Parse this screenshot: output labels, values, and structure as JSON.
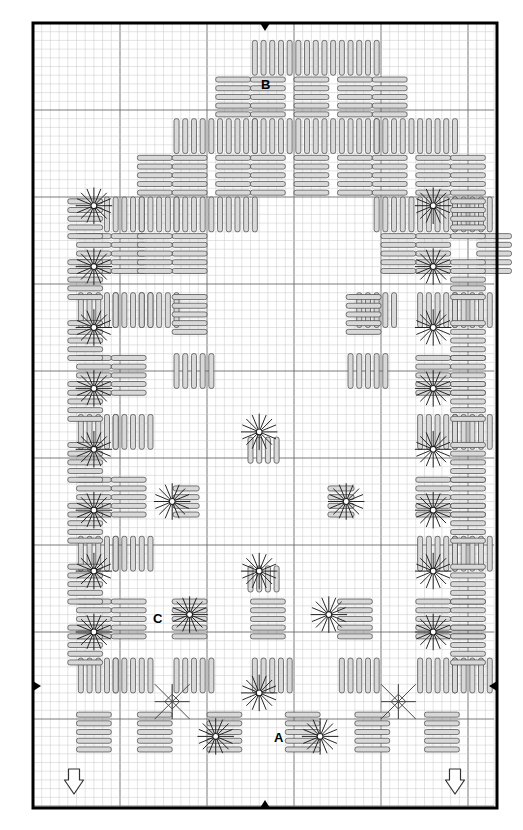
{
  "document": {
    "type": "needlework-chart",
    "technique": "Hardanger embroidery",
    "title": "Hardanger Chart",
    "width_px": 523,
    "height_px": 830
  },
  "canvas": {
    "border": {
      "x": 33,
      "y": 23,
      "w": 464,
      "h": 785,
      "stroke": "#000000",
      "stroke_width": 3
    },
    "grid": {
      "cell_px": 8.7,
      "minor_color": "#c8c8c8",
      "major_color": "#6b6b6b",
      "major_every": 10,
      "origin_x": 33,
      "origin_y": 23,
      "cols": 53,
      "rows": 90
    },
    "background": "#ffffff"
  },
  "colors": {
    "stitch_fill": "#d9d9d9",
    "stitch_stroke": "#4a4a4a",
    "eyelet_stroke": "#1a1a1a",
    "label_color": "#000000",
    "arrow_stroke": "#333333",
    "arrow_fill": "#ffffff",
    "marker_fill": "#000000"
  },
  "labels": [
    {
      "id": "label-b",
      "text": "B",
      "x": 261,
      "y": 78
    },
    {
      "id": "label-c",
      "text": "C",
      "x": 153,
      "y": 612
    },
    {
      "id": "label-a",
      "text": "A",
      "x": 274,
      "y": 731
    }
  ],
  "center_markers": [
    {
      "id": "marker-top",
      "direction": "down",
      "x": 265,
      "y": 24
    },
    {
      "id": "marker-bottom",
      "direction": "up",
      "x": 265,
      "y": 807
    },
    {
      "id": "marker-left",
      "direction": "right",
      "x": 34,
      "y": 686
    },
    {
      "id": "marker-right",
      "direction": "left",
      "x": 496,
      "y": 686
    }
  ],
  "direction_arrows": [
    {
      "id": "arrow-bottom-left",
      "direction": "down",
      "x": 74,
      "y": 780
    },
    {
      "id": "arrow-bottom-right",
      "direction": "down",
      "x": 455,
      "y": 780
    }
  ],
  "legend_keys": {
    "A": "Satin stitch / kloster block band",
    "B": "Kloster block",
    "C": "Eyelet / woven filling area"
  },
  "chart_data": {
    "type": "grid-pattern",
    "cell": 8.7,
    "unit_note": "coordinates are grid units from chart origin",
    "kloster_blocks": [
      {
        "c": 25,
        "r": 2,
        "o": "h"
      },
      {
        "c": 30,
        "r": 2,
        "o": "h"
      },
      {
        "c": 35,
        "r": 2,
        "o": "h"
      },
      {
        "c": 21,
        "r": 6,
        "o": "v"
      },
      {
        "c": 25,
        "r": 6,
        "o": "v"
      },
      {
        "c": 30,
        "r": 6,
        "o": "v"
      },
      {
        "c": 35,
        "r": 6,
        "o": "v"
      },
      {
        "c": 39,
        "r": 6,
        "o": "v"
      },
      {
        "c": 16,
        "r": 11,
        "o": "h"
      },
      {
        "c": 21,
        "r": 11,
        "o": "h"
      },
      {
        "c": 25,
        "r": 11,
        "o": "h"
      },
      {
        "c": 30,
        "r": 11,
        "o": "h"
      },
      {
        "c": 35,
        "r": 11,
        "o": "h"
      },
      {
        "c": 39,
        "r": 11,
        "o": "h"
      },
      {
        "c": 44,
        "r": 11,
        "o": "h"
      },
      {
        "c": 12,
        "r": 15,
        "o": "v"
      },
      {
        "c": 16,
        "r": 15,
        "o": "v"
      },
      {
        "c": 21,
        "r": 15,
        "o": "v"
      },
      {
        "c": 25,
        "r": 15,
        "o": "v"
      },
      {
        "c": 30,
        "r": 15,
        "o": "v"
      },
      {
        "c": 35,
        "r": 15,
        "o": "v"
      },
      {
        "c": 39,
        "r": 15,
        "o": "v"
      },
      {
        "c": 44,
        "r": 15,
        "o": "v"
      },
      {
        "c": 48,
        "r": 15,
        "o": "v"
      },
      {
        "c": 8,
        "r": 20,
        "o": "h"
      },
      {
        "c": 12,
        "r": 20,
        "o": "h"
      },
      {
        "c": 16,
        "r": 20,
        "o": "h"
      },
      {
        "c": 21,
        "r": 20,
        "o": "h"
      },
      {
        "c": 39,
        "r": 20,
        "o": "h"
      },
      {
        "c": 44,
        "r": 20,
        "o": "h"
      },
      {
        "c": 48,
        "r": 20,
        "o": "h"
      },
      {
        "c": 5,
        "r": 24,
        "o": "v"
      },
      {
        "c": 9,
        "r": 24,
        "o": "v"
      },
      {
        "c": 16,
        "r": 24,
        "o": "v"
      },
      {
        "c": 44,
        "r": 24,
        "o": "v"
      },
      {
        "c": 51,
        "r": 24,
        "o": "v"
      },
      {
        "c": 5,
        "r": 31,
        "o": "h"
      },
      {
        "c": 9,
        "r": 31,
        "o": "h"
      },
      {
        "c": 44,
        "r": 31,
        "o": "h"
      },
      {
        "c": 48,
        "r": 31,
        "o": "h"
      },
      {
        "c": 5,
        "r": 38,
        "o": "v"
      },
      {
        "c": 9,
        "r": 38,
        "o": "v"
      },
      {
        "c": 44,
        "r": 38,
        "o": "v"
      },
      {
        "c": 48,
        "r": 38,
        "o": "v"
      },
      {
        "c": 5,
        "r": 45,
        "o": "h"
      },
      {
        "c": 9,
        "r": 45,
        "o": "h"
      },
      {
        "c": 44,
        "r": 45,
        "o": "h"
      },
      {
        "c": 48,
        "r": 45,
        "o": "h"
      },
      {
        "c": 5,
        "r": 52,
        "o": "v"
      },
      {
        "c": 9,
        "r": 52,
        "o": "v"
      },
      {
        "c": 44,
        "r": 52,
        "o": "v"
      },
      {
        "c": 48,
        "r": 52,
        "o": "v"
      },
      {
        "c": 5,
        "r": 59,
        "o": "h"
      },
      {
        "c": 9,
        "r": 59,
        "o": "h"
      },
      {
        "c": 44,
        "r": 59,
        "o": "h"
      },
      {
        "c": 48,
        "r": 59,
        "o": "h"
      },
      {
        "c": 5,
        "r": 66,
        "o": "v"
      },
      {
        "c": 9,
        "r": 66,
        "o": "v"
      },
      {
        "c": 16,
        "r": 66,
        "o": "v"
      },
      {
        "c": 25,
        "r": 66,
        "o": "v"
      },
      {
        "c": 35,
        "r": 66,
        "o": "v"
      },
      {
        "c": 44,
        "r": 66,
        "o": "v"
      },
      {
        "c": 48,
        "r": 66,
        "o": "v"
      },
      {
        "c": 5,
        "r": 73,
        "o": "h"
      },
      {
        "c": 9,
        "r": 73,
        "o": "h"
      },
      {
        "c": 16,
        "r": 73,
        "o": "h"
      },
      {
        "c": 25,
        "r": 73,
        "o": "h"
      },
      {
        "c": 35,
        "r": 73,
        "o": "h"
      },
      {
        "c": 44,
        "r": 73,
        "o": "h"
      },
      {
        "c": 48,
        "r": 73,
        "o": "h"
      },
      {
        "c": 5,
        "r": 79,
        "o": "v"
      },
      {
        "c": 12,
        "r": 79,
        "o": "v"
      },
      {
        "c": 20,
        "r": 79,
        "o": "v"
      },
      {
        "c": 29,
        "r": 79,
        "o": "v"
      },
      {
        "c": 37,
        "r": 79,
        "o": "v"
      },
      {
        "c": 45,
        "r": 79,
        "o": "v"
      }
    ],
    "eyelets": [
      {
        "c": 7,
        "r": 21
      },
      {
        "c": 7,
        "r": 28
      },
      {
        "c": 7,
        "r": 35
      },
      {
        "c": 7,
        "r": 42
      },
      {
        "c": 7,
        "r": 49
      },
      {
        "c": 7,
        "r": 56
      },
      {
        "c": 7,
        "r": 63
      },
      {
        "c": 7,
        "r": 70
      },
      {
        "c": 46,
        "r": 21
      },
      {
        "c": 46,
        "r": 28
      },
      {
        "c": 46,
        "r": 35
      },
      {
        "c": 46,
        "r": 42
      },
      {
        "c": 46,
        "r": 49
      },
      {
        "c": 46,
        "r": 56
      },
      {
        "c": 46,
        "r": 63
      },
      {
        "c": 46,
        "r": 70
      },
      {
        "c": 26,
        "r": 47
      },
      {
        "c": 16,
        "r": 55
      },
      {
        "c": 36,
        "r": 55
      },
      {
        "c": 26,
        "r": 63
      },
      {
        "c": 18,
        "r": 68
      },
      {
        "c": 34,
        "r": 68
      },
      {
        "c": 26,
        "r": 77
      },
      {
        "c": 21,
        "r": 82
      },
      {
        "c": 33,
        "r": 82
      }
    ],
    "center_star": {
      "center_c": 26.5,
      "center_r": 55,
      "description": "stepped satin-stitch diamond star / klosterblock medallion"
    },
    "woven_fillings": [
      {
        "c": 14,
        "r": 76,
        "kind": "doves-eye"
      },
      {
        "c": 40,
        "r": 76,
        "kind": "doves-eye"
      }
    ]
  }
}
